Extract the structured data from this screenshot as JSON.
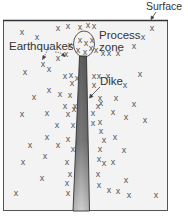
{
  "diagram": {
    "labels": {
      "surface": "Surface",
      "process_zone_line1": "Process",
      "process_zone_line2": "zone",
      "earthquakes": "Earthquakes",
      "dike": "Dike"
    },
    "earthquake_marker": "x",
    "colors": {
      "background": "#ffffff",
      "box_fill": "#f2f2f2",
      "box_stroke": "#444444",
      "dike_dark": "#6a6a6a",
      "dike_light": "#c8c8c8",
      "marker": "#555555"
    },
    "earthquakes": [
      [
        22,
        32
      ],
      [
        58,
        28
      ],
      [
        68,
        26
      ],
      [
        80,
        27
      ],
      [
        88,
        25
      ],
      [
        94,
        26
      ],
      [
        152,
        28
      ],
      [
        37,
        37
      ],
      [
        143,
        37
      ],
      [
        134,
        46
      ],
      [
        70,
        45
      ],
      [
        66,
        54
      ],
      [
        58,
        58
      ],
      [
        43,
        64
      ],
      [
        49,
        69
      ],
      [
        80,
        40
      ],
      [
        86,
        43
      ],
      [
        92,
        40
      ],
      [
        78,
        50
      ],
      [
        85,
        52
      ],
      [
        91,
        48
      ],
      [
        96,
        50
      ],
      [
        103,
        53
      ],
      [
        109,
        53
      ],
      [
        118,
        53
      ],
      [
        25,
        72
      ],
      [
        65,
        76
      ],
      [
        71,
        75
      ],
      [
        77,
        78
      ],
      [
        94,
        76
      ],
      [
        99,
        76
      ],
      [
        108,
        76
      ],
      [
        140,
        74
      ],
      [
        72,
        83
      ],
      [
        94,
        85
      ],
      [
        125,
        85
      ],
      [
        49,
        90
      ],
      [
        60,
        94
      ],
      [
        70,
        95
      ],
      [
        34,
        97
      ],
      [
        100,
        98
      ],
      [
        116,
        98
      ],
      [
        134,
        104
      ],
      [
        65,
        106
      ],
      [
        75,
        106
      ],
      [
        98,
        106
      ],
      [
        101,
        103
      ],
      [
        22,
        114
      ],
      [
        47,
        113
      ],
      [
        68,
        114
      ],
      [
        74,
        109
      ],
      [
        93,
        113
      ],
      [
        113,
        112
      ],
      [
        126,
        117
      ],
      [
        145,
        120
      ],
      [
        57,
        125
      ],
      [
        73,
        125
      ],
      [
        93,
        123
      ],
      [
        100,
        122
      ],
      [
        101,
        131
      ],
      [
        47,
        137
      ],
      [
        68,
        139
      ],
      [
        104,
        140
      ],
      [
        115,
        137
      ],
      [
        30,
        145
      ],
      [
        58,
        145
      ],
      [
        73,
        149
      ],
      [
        100,
        149
      ],
      [
        124,
        150
      ],
      [
        23,
        162
      ],
      [
        45,
        156
      ],
      [
        67,
        162
      ],
      [
        99,
        159
      ],
      [
        104,
        163
      ],
      [
        113,
        162
      ],
      [
        70,
        174
      ],
      [
        98,
        174
      ],
      [
        42,
        178
      ],
      [
        67,
        183
      ],
      [
        126,
        180
      ],
      [
        16,
        193
      ],
      [
        68,
        193
      ],
      [
        99,
        185
      ],
      [
        109,
        190
      ],
      [
        118,
        191
      ],
      [
        129,
        195
      ],
      [
        156,
        195
      ]
    ]
  }
}
